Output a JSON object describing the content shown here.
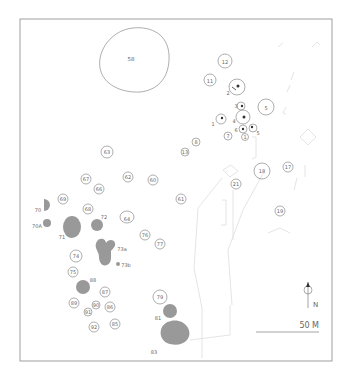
{
  "map": {
    "title": "",
    "scale_bar": {
      "label": "50 M"
    },
    "north_arrow": {
      "label": "N"
    },
    "features": {
      "f58": "58",
      "f12": "12",
      "f11": "11",
      "f2": "2",
      "f3": "3",
      "f5": "5",
      "f1": "1",
      "f4": "4",
      "f6": "6",
      "f7": "7",
      "f9": "1",
      "f10": "5",
      "f8": "8",
      "f13": "13",
      "f63": "63",
      "f67": "67",
      "f62": "62",
      "f60": "60",
      "f66": "66",
      "f69": "69",
      "f70": "70",
      "f68": "68",
      "f72": "72",
      "f64": "64",
      "f70a": "70A",
      "f71": "71",
      "f73a": "73a",
      "f73b": "73b",
      "f76": "76",
      "f77": "77",
      "f74": "74",
      "f75": "75",
      "f88": "88",
      "f87": "87",
      "f89": "89",
      "f90": "90",
      "f86": "86",
      "f91": "91",
      "f92": "92",
      "f85": "85",
      "f79": "79",
      "f81": "81",
      "f83": "83",
      "f61": "61",
      "f21": "21",
      "f18": "18",
      "f17": "17",
      "f19": "19"
    }
  }
}
